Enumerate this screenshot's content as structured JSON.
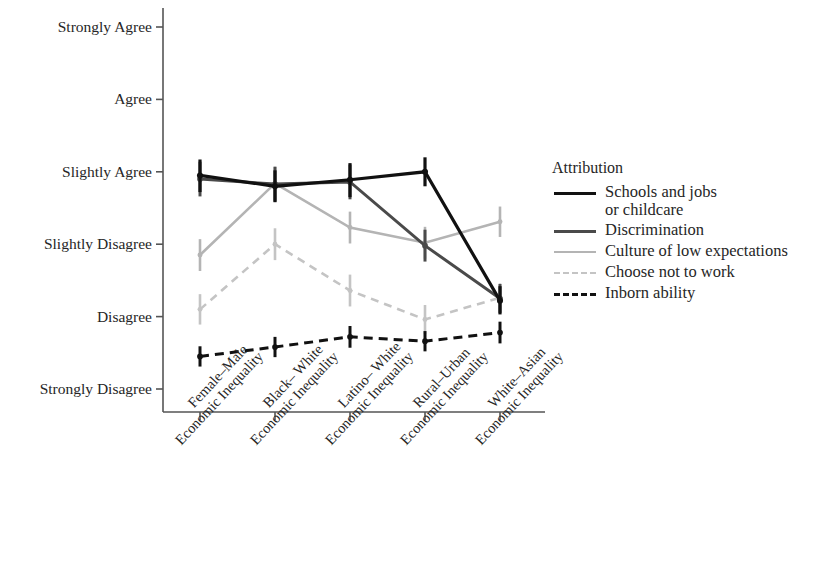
{
  "chart_data": {
    "type": "line",
    "title": "",
    "xlabel": "",
    "ylabel": "",
    "grid": false,
    "legend_position": "right",
    "categories": [
      "Female–Male\nEconomic Inequality",
      "Black– White\nEconomic Inequality",
      "Latino– White\nEconomic Inequality",
      "Rural–Urban\nEconomic Inequality",
      "White–Asian\nEconomic Inequality"
    ],
    "ytick_labels": [
      "Strongly Disagree",
      "Disagree",
      "Slightly Disagree",
      "Slightly Agree",
      "Agree",
      "Strongly Agree"
    ],
    "ytick_values": [
      1,
      2,
      3,
      4,
      5,
      6
    ],
    "ylim": [
      1,
      6
    ],
    "series": [
      {
        "name": "Schools and jobs or childcare",
        "color": "#111111",
        "dash": "solid",
        "width": 3.2,
        "values": [
          3.95,
          3.8,
          3.89,
          4.0,
          2.22
        ],
        "err_low": [
          3.72,
          3.58,
          3.65,
          3.8,
          2.03
        ],
        "err_high": [
          4.17,
          4.02,
          4.12,
          4.2,
          2.42
        ]
      },
      {
        "name": "Discrimination",
        "color": "#4a4a4a",
        "dash": "solid",
        "width": 3.0,
        "values": [
          3.9,
          3.83,
          3.86,
          2.98,
          2.25
        ],
        "err_low": [
          3.66,
          3.59,
          3.62,
          2.76,
          2.05
        ],
        "err_high": [
          4.14,
          4.07,
          4.1,
          3.2,
          2.45
        ]
      },
      {
        "name": "Culture of low expectations",
        "color": "#b4b4b4",
        "dash": "solid",
        "width": 2.6,
        "values": [
          2.85,
          3.84,
          3.23,
          3.02,
          3.31
        ],
        "err_low": [
          2.63,
          3.61,
          3.01,
          2.8,
          3.1
        ],
        "err_high": [
          3.07,
          4.07,
          3.45,
          3.24,
          3.52
        ]
      },
      {
        "name": "Choose not to work",
        "color": "#c4c4c4",
        "dash": "dashed",
        "width": 2.6,
        "values": [
          2.1,
          3.0,
          2.36,
          1.96,
          2.26
        ],
        "err_low": [
          1.89,
          2.78,
          2.14,
          1.76,
          2.06
        ],
        "err_high": [
          2.31,
          3.22,
          2.58,
          2.16,
          2.46
        ]
      },
      {
        "name": "Inborn ability",
        "color": "#111111",
        "dash": "dashed",
        "width": 3.0,
        "values": [
          1.45,
          1.58,
          1.72,
          1.66,
          1.78
        ],
        "err_low": [
          1.31,
          1.44,
          1.57,
          1.52,
          1.63
        ],
        "err_high": [
          1.59,
          1.72,
          1.87,
          1.8,
          1.93
        ]
      }
    ]
  },
  "legend": {
    "title": "Attribution",
    "entries": [
      {
        "label": "Schools and jobs\nor childcare"
      },
      {
        "label": "Discrimination"
      },
      {
        "label": "Culture of low expectations"
      },
      {
        "label": "Choose not to work"
      },
      {
        "label": "Inborn ability"
      }
    ]
  },
  "axis": {
    "line_color": "#555555"
  }
}
